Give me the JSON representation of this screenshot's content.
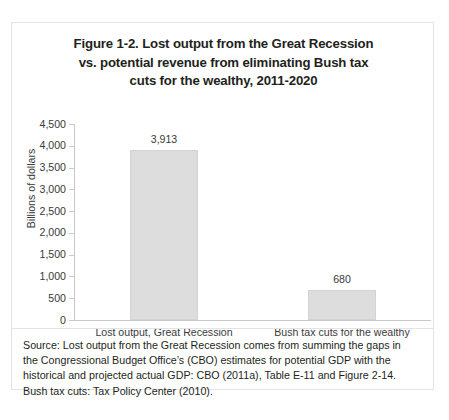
{
  "figure": {
    "title_lines": [
      "Figure 1-2. Lost output from the Great Recession",
      "vs. potential revenue from eliminating Bush tax",
      "cuts for the wealthy, 2011-2020"
    ],
    "source_lines": [
      "Source: Lost output from the Great Recession comes from summing the gaps in",
      "the Congressional Budget Office’s (CBO) estimates for potential GDP with the",
      "historical and projected actual GDP: CBO (2011a), Table E-11 and Figure 2-14.",
      "Bush tax cuts: Tax Policy Center (2010)."
    ]
  },
  "chart_data": {
    "type": "bar",
    "title": "Figure 1-2. Lost output from the Great Recession vs. potential revenue from eliminating Bush tax cuts for the wealthy, 2011-2020",
    "categories": [
      "Lost output, Great Recession",
      "Bush tax cuts for the wealthy"
    ],
    "values": [
      3913,
      680
    ],
    "value_labels": [
      "3,913",
      "680"
    ],
    "xlabel": "",
    "ylabel": "Billions of dollars",
    "ylim": [
      0,
      4500
    ],
    "ytick_values": [
      4500,
      4000,
      3500,
      3000,
      2500,
      2000,
      1500,
      1000,
      500,
      0
    ],
    "ytick_labels": [
      "4,500",
      "4,000",
      "3,500",
      "3,000",
      "2,500",
      "2,000",
      "1,500",
      "1,000",
      "500",
      "0"
    ],
    "grid": false,
    "legend": false,
    "bar_color": "#dddddd",
    "axis_color": "#c9c9c9"
  }
}
